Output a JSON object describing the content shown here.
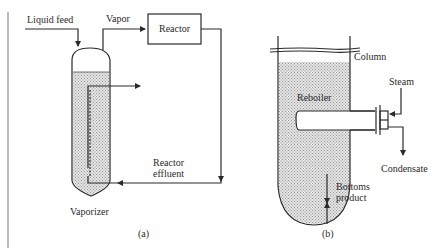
{
  "diagram_a": {
    "caption": "(a)",
    "labels": {
      "liquid_feed": "Liquid feed",
      "vapor": "Vapor",
      "reactor": "Reactor",
      "reactor_effluent_line1": "Reactor",
      "reactor_effluent_line2": "effluent",
      "vaporizer": "Vaporizer"
    }
  },
  "diagram_b": {
    "caption": "(b)",
    "labels": {
      "column": "Column",
      "reboiler": "Reboiler",
      "steam": "Steam",
      "condensate": "Condensate",
      "bottoms_line1": "Bottoms",
      "bottoms_line2": "product"
    }
  },
  "colors": {
    "line": "#2a2a2a",
    "fill_hatch": "#d8d8d8",
    "background": "#ffffff"
  }
}
